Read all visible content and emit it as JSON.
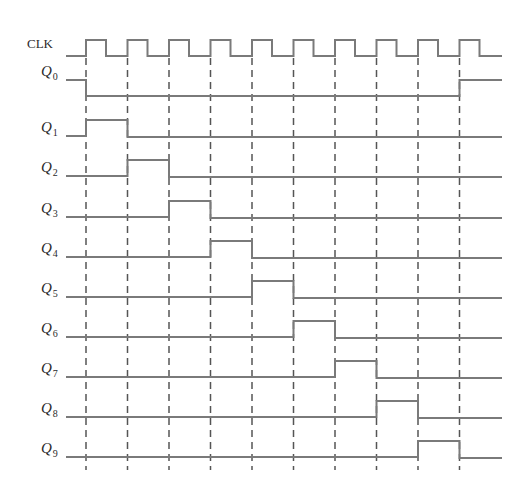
{
  "diagram": {
    "type": "timing-diagram",
    "colors": {
      "waveform": "#7a7a7a",
      "dashed_guides": "#555555",
      "label": "#2a2a2a",
      "background": "#ffffff"
    },
    "x_start": 66,
    "x_end": 502,
    "clock_edges_x": [
      86,
      127.5,
      169,
      210.5,
      252,
      293.5,
      335,
      376.5,
      418,
      459.5
    ],
    "clock_high_width": 20,
    "clock": {
      "label": "CLK",
      "high_y": 40,
      "low_y": 56
    },
    "signals": [
      {
        "label": "Q",
        "sub": "0",
        "low_y": 96,
        "high_y": 80,
        "initial": 1,
        "high_from_edge": null,
        "high_to_edge": 0,
        "rise_again_edge": 9
      },
      {
        "label": "Q",
        "sub": "1",
        "low_y": 136,
        "high_y": 120,
        "initial": 0,
        "high_from_edge": 0,
        "high_to_edge": 1
      },
      {
        "label": "Q",
        "sub": "2",
        "low_y": 176,
        "high_y": 160,
        "initial": 0,
        "high_from_edge": 1,
        "high_to_edge": 2
      },
      {
        "label": "Q",
        "sub": "3",
        "low_y": 217,
        "high_y": 201,
        "initial": 0,
        "high_from_edge": 2,
        "high_to_edge": 3
      },
      {
        "label": "Q",
        "sub": "4",
        "low_y": 257,
        "high_y": 241,
        "initial": 0,
        "high_from_edge": 3,
        "high_to_edge": 4
      },
      {
        "label": "Q",
        "sub": "5",
        "low_y": 297,
        "high_y": 281,
        "initial": 0,
        "high_from_edge": 4,
        "high_to_edge": 5
      },
      {
        "label": "Q",
        "sub": "6",
        "low_y": 337,
        "high_y": 321,
        "initial": 0,
        "high_from_edge": 5,
        "high_to_edge": 6
      },
      {
        "label": "Q",
        "sub": "7",
        "low_y": 377,
        "high_y": 361,
        "initial": 0,
        "high_from_edge": 6,
        "high_to_edge": 7
      },
      {
        "label": "Q",
        "sub": "8",
        "low_y": 417,
        "high_y": 401,
        "initial": 0,
        "high_from_edge": 7,
        "high_to_edge": 8
      },
      {
        "label": "Q",
        "sub": "9",
        "low_y": 457,
        "high_y": 441,
        "initial": 0,
        "high_from_edge": 8,
        "high_to_edge": 9
      }
    ],
    "dashed_guides": {
      "y_top": 58,
      "y_bottom": 470
    }
  }
}
